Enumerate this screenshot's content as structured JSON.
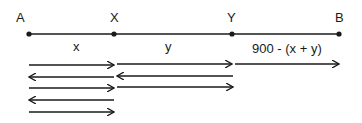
{
  "points": [
    {
      "name": "A",
      "x": 29
    },
    {
      "name": "X",
      "x": 114
    },
    {
      "name": "Y",
      "x": 232
    },
    {
      "name": "B",
      "x": 339
    }
  ],
  "segments": [
    {
      "label": "x"
    },
    {
      "label": "y"
    },
    {
      "label": "900 - (x + y)"
    }
  ],
  "colors": {
    "line": "#1a1a1a",
    "background": "#ffffff"
  }
}
